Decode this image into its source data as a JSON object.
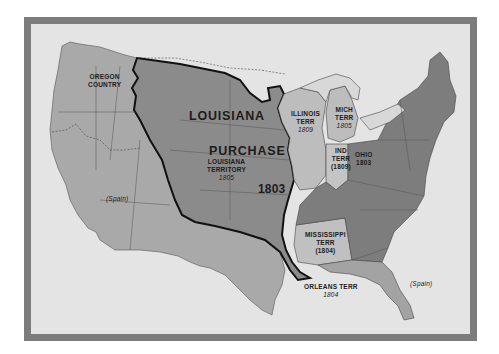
{
  "map": {
    "title": "Louisiana Purchase",
    "colors": {
      "frame": "#7c7c7c",
      "paper": "#e4e4e4",
      "west_territory": "#a9a9a9",
      "purchase": "#8b8b8b",
      "us_states": "#7d7d7d",
      "territories_light": "#bdbdbd",
      "spanish_florida": "#a3a3a3",
      "boundary": "#111111"
    },
    "labels": {
      "oregon": [
        "OREGON",
        "COUNTRY"
      ],
      "louisiana": "LOUISIANA",
      "purchase": "PURCHASE",
      "louisiana_territory": [
        "LOUISIANA",
        "TERRITORY"
      ],
      "louisiana_territory_year": "1805",
      "purchase_year": "1803",
      "illinois": [
        "ILLINOIS",
        "TERR"
      ],
      "illinois_year": "1809",
      "michigan": [
        "MICH",
        "TERR"
      ],
      "michigan_year": "1805",
      "indiana": [
        "IND",
        "TERR"
      ],
      "indiana_year": "(1809)",
      "ohio": "OHIO",
      "ohio_year": "1803",
      "mississippi": [
        "MISSISSIPPI",
        "TERR"
      ],
      "mississippi_year": "(1804)",
      "orleans": "ORLEANS TERR",
      "orleans_year": "1804",
      "spain_west": "(Spain)",
      "spain_florida": "(Spain)"
    }
  }
}
